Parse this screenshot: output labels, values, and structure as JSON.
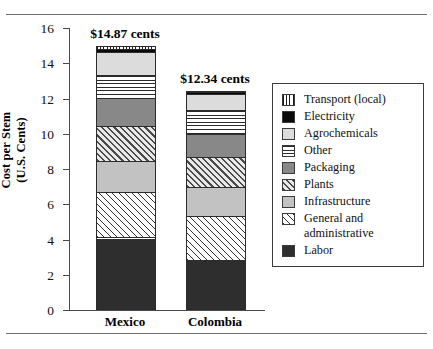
{
  "chart_data": {
    "type": "bar",
    "subtype": "stacked-bar",
    "title": "",
    "xlabel": "",
    "ylabel": "Cost per Stem (U.S. Cents)",
    "ylabel_line1": "Cost per Stem",
    "ylabel_line2": "(U.S. Cents)",
    "categories": [
      "Mexico",
      "Colombia"
    ],
    "ylim": [
      0,
      16
    ],
    "ytick_labels": [
      "0",
      "2",
      "4",
      "6",
      "8",
      "10",
      "12",
      "14",
      "16"
    ],
    "ytick_values": [
      0,
      2,
      4,
      6,
      8,
      10,
      12,
      14,
      16
    ],
    "grid": false,
    "legend_position": "right",
    "stack_order_bottom_to_top": [
      "Labor",
      "General and administrative",
      "Infrastructure",
      "Plants",
      "Packaging",
      "Other",
      "Agrochemicals",
      "Electricity",
      "Transport (local)"
    ],
    "series": [
      {
        "name": "Labor",
        "values": [
          4.0,
          2.7
        ]
      },
      {
        "name": "General and administrative",
        "values": [
          2.6,
          2.5
        ]
      },
      {
        "name": "Infrastructure",
        "values": [
          1.75,
          1.65
        ]
      },
      {
        "name": "Plants",
        "values": [
          2.0,
          1.7
        ]
      },
      {
        "name": "Packaging",
        "values": [
          1.55,
          1.3
        ]
      },
      {
        "name": "Other",
        "values": [
          1.3,
          1.4
        ]
      },
      {
        "name": "Agrochemicals",
        "values": [
          1.3,
          0.9
        ]
      },
      {
        "name": "Electricity",
        "values": [
          0.22,
          0.13
        ]
      },
      {
        "name": "Transport (local)",
        "values": [
          0.15,
          0.06
        ]
      }
    ],
    "totals": [
      14.87,
      12.34
    ],
    "total_labels": [
      "$14.87 cents",
      "$12.34 cents"
    ]
  },
  "bars": [
    {
      "category": "Mexico",
      "total_label": "$14.87 cents",
      "segments": [
        {
          "name": "Transport (local)",
          "value": 0.15,
          "from": 14.72,
          "to": 14.87,
          "pattern": "p-transport"
        },
        {
          "name": "Electricity",
          "value": 0.22,
          "from": 14.5,
          "to": 14.72,
          "pattern": "p-electricity"
        },
        {
          "name": "Agrochemicals",
          "value": 1.3,
          "from": 13.2,
          "to": 14.5,
          "pattern": "p-agro"
        },
        {
          "name": "Other",
          "value": 1.3,
          "from": 11.9,
          "to": 13.2,
          "pattern": "p-other"
        },
        {
          "name": "Packaging",
          "value": 1.55,
          "from": 10.35,
          "to": 11.9,
          "pattern": "p-packaging"
        },
        {
          "name": "Plants",
          "value": 2.0,
          "from": 8.35,
          "to": 10.35,
          "pattern": "p-plants"
        },
        {
          "name": "Infrastructure",
          "value": 1.75,
          "from": 6.6,
          "to": 8.35,
          "pattern": "p-infra"
        },
        {
          "name": "General and administrative",
          "value": 2.6,
          "from": 4.0,
          "to": 6.6,
          "pattern": "p-genadmin"
        },
        {
          "name": "Labor",
          "value": 4.0,
          "from": 0.0,
          "to": 4.0,
          "pattern": "p-labor"
        }
      ]
    },
    {
      "category": "Colombia",
      "total_label": "$12.34 cents",
      "segments": [
        {
          "name": "Transport (local)",
          "value": 0.06,
          "from": 12.28,
          "to": 12.34,
          "pattern": "p-transport"
        },
        {
          "name": "Electricity",
          "value": 0.13,
          "from": 12.15,
          "to": 12.28,
          "pattern": "p-electricity"
        },
        {
          "name": "Agrochemicals",
          "value": 0.9,
          "from": 11.25,
          "to": 12.15,
          "pattern": "p-agro"
        },
        {
          "name": "Other",
          "value": 1.4,
          "from": 9.85,
          "to": 11.25,
          "pattern": "p-other"
        },
        {
          "name": "Packaging",
          "value": 1.3,
          "from": 8.55,
          "to": 9.85,
          "pattern": "p-packaging"
        },
        {
          "name": "Plants",
          "value": 1.7,
          "from": 6.85,
          "to": 8.55,
          "pattern": "p-plants"
        },
        {
          "name": "Infrastructure",
          "value": 1.65,
          "from": 5.2,
          "to": 6.85,
          "pattern": "p-infra"
        },
        {
          "name": "General and administrative",
          "value": 2.5,
          "from": 2.7,
          "to": 5.2,
          "pattern": "p-genadmin"
        },
        {
          "name": "Labor",
          "value": 2.7,
          "from": 0.0,
          "to": 2.7,
          "pattern": "p-labor"
        }
      ]
    }
  ],
  "legend": {
    "items": [
      {
        "label": "Transport (local)",
        "label_line2": "",
        "pattern": "p-transport"
      },
      {
        "label": "Electricity",
        "label_line2": "",
        "pattern": "p-electricity"
      },
      {
        "label": "Agrochemicals",
        "label_line2": "",
        "pattern": "p-agro"
      },
      {
        "label": "Other",
        "label_line2": "",
        "pattern": "p-other"
      },
      {
        "label": "Packaging",
        "label_line2": "",
        "pattern": "p-packaging"
      },
      {
        "label": "Plants",
        "label_line2": "",
        "pattern": "p-plants"
      },
      {
        "label": "Infrastructure",
        "label_line2": "",
        "pattern": "p-infra"
      },
      {
        "label": "General and",
        "label_line2": "administrative",
        "pattern": "p-genadmin"
      },
      {
        "label": "Labor",
        "label_line2": "",
        "pattern": "p-labor"
      }
    ]
  },
  "colors": {
    "labor": "#2e2e2e",
    "infrastructure": "#c2c2c2",
    "packaging": "#888888",
    "agrochemicals": "#dcdcdc",
    "electricity": "#0a0a0a",
    "axis": "#4a4a4a",
    "frame_rule": "#6e6e6e",
    "background": "#ffffff"
  }
}
